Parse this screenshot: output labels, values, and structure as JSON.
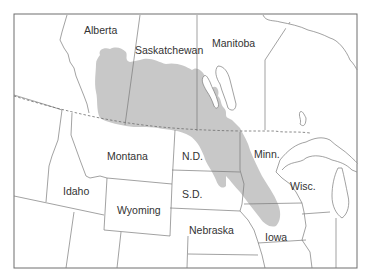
{
  "map": {
    "type": "regional distribution map",
    "shaded_region_color": "#c8c8c8",
    "border_color": "#7a7a7a",
    "background_color": "#ffffff",
    "international_border_style": "dashed",
    "labels": {
      "alberta": "Alberta",
      "saskatchewan": "Saskatchewan",
      "manitoba": "Manitoba",
      "montana": "Montana",
      "north_dakota": "N.D.",
      "south_dakota": "S.D.",
      "minnesota": "Minn.",
      "wisconsin": "Wisc.",
      "idaho": "Idaho",
      "wyoming": "Wyoming",
      "nebraska": "Nebraska",
      "iowa": "Iowa"
    }
  }
}
